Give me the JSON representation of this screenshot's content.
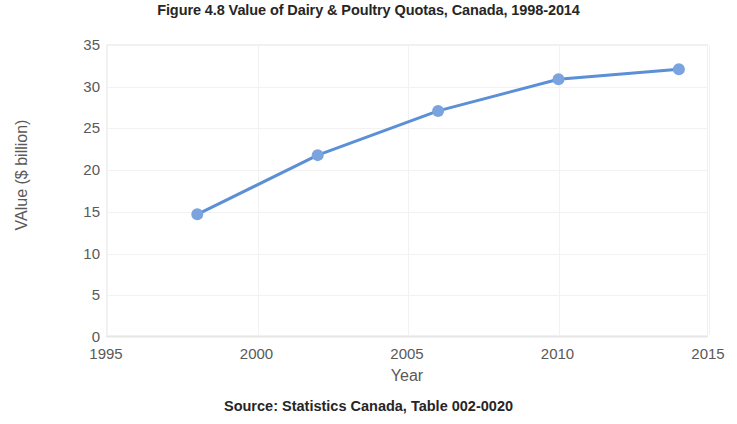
{
  "chart_data": {
    "type": "line",
    "title": "Figure 4.8 Value of Dairy & Poultry Quotas, Canada, 1998-2014",
    "subtitle": "",
    "xlabel": "Year",
    "ylabel": "VAlue ($ billion)",
    "x": [
      1998,
      2002,
      2006,
      2010,
      2014
    ],
    "values": [
      14.7,
      21.8,
      27.1,
      30.9,
      32.1
    ],
    "series": [
      {
        "name": "Value of Dairy & Poultry Quotas",
        "values": [
          14.7,
          21.8,
          27.1,
          30.9,
          32.1
        ]
      }
    ],
    "xlim": [
      1995,
      2015
    ],
    "ylim": [
      0,
      35
    ],
    "xticks": [
      1995,
      2000,
      2005,
      2010,
      2015
    ],
    "yticks": [
      0,
      5,
      10,
      15,
      20,
      25,
      30,
      35
    ],
    "xtick_labels": [
      "1995",
      "2000",
      "2005",
      "2010",
      "2015"
    ],
    "ytick_labels": [
      "0",
      "5",
      "10",
      "15",
      "20",
      "25",
      "30",
      "35"
    ],
    "grid": true,
    "legend": false,
    "legend_position": "none",
    "marker": "circle",
    "annotations": [],
    "colors": {
      "series_line": "#5B8FD6",
      "marker_fill": "#7BA3DE",
      "gridline": "#F2F2F2",
      "axis_text": "#595959",
      "title_text": "#262626",
      "plot_border": "#F0F0F0",
      "background": "#FFFFFF"
    }
  },
  "source": {
    "note": "Source: Statistics Canada, Table 002-0020"
  }
}
